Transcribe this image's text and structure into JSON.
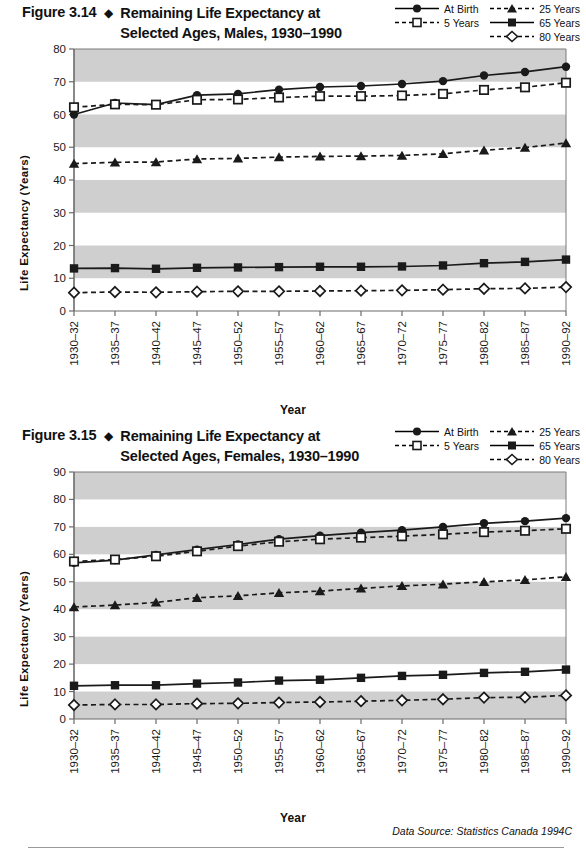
{
  "page": {
    "source_note": "Data Source: Statistics Canada 1994C"
  },
  "figures": [
    {
      "number": "Figure 3.14",
      "separator": "◆",
      "title_line1": "Remaining Life Expectancy at",
      "title_line2": "Selected Ages, Males, 1930–1990",
      "xlabel": "Year",
      "ylabel": "Life Expectancy (Years)",
      "legend": [
        {
          "label": "At Birth",
          "marker": "circle-filled",
          "dash": "solid"
        },
        {
          "label": "25 Years",
          "marker": "triangle-filled",
          "dash": "dashed"
        },
        {
          "label": "5 Years",
          "marker": "square-open",
          "dash": "dashed"
        },
        {
          "label": "65 Years",
          "marker": "square-filled",
          "dash": "solid"
        },
        {
          "label": "80 Years",
          "marker": "diamond-open",
          "dash": "dashed"
        }
      ]
    },
    {
      "number": "Figure 3.15",
      "separator": "◆",
      "title_line1": "Remaining Life Expectancy at",
      "title_line2": "Selected Ages, Females, 1930–1990",
      "xlabel": "Year",
      "ylabel": "Life Expectancy (Years)",
      "legend": [
        {
          "label": "At Birth",
          "marker": "circle-filled",
          "dash": "solid"
        },
        {
          "label": "25 Years",
          "marker": "triangle-filled",
          "dash": "dashed"
        },
        {
          "label": "5 Years",
          "marker": "square-open",
          "dash": "dashed"
        },
        {
          "label": "65 Years",
          "marker": "square-filled",
          "dash": "solid"
        },
        {
          "label": "80 Years",
          "marker": "diamond-open",
          "dash": "dashed"
        }
      ]
    }
  ],
  "chart_data": [
    {
      "type": "line",
      "title": "Figure 3.14 ◆ Remaining Life Expectancy at Selected Ages, Males, 1930–1990",
      "xlabel": "Year",
      "ylabel": "Life Expectancy (Years)",
      "ylim": [
        0,
        80
      ],
      "yticks": [
        0,
        10,
        20,
        30,
        40,
        50,
        60,
        70,
        80
      ],
      "grid": "horizontal-bands",
      "legend_position": "top-right",
      "categories": [
        "1930–32",
        "1935–37",
        "1940–42",
        "1945–47",
        "1950–52",
        "1955–57",
        "1960–62",
        "1965–67",
        "1970–72",
        "1975–77",
        "1980–82",
        "1985–87",
        "1990–92"
      ],
      "series": [
        {
          "name": "At Birth",
          "marker": "circle-filled",
          "dash": "solid",
          "values": [
            60.0,
            63.5,
            63.0,
            65.9,
            66.3,
            67.6,
            68.4,
            68.7,
            69.3,
            70.2,
            71.9,
            73.0,
            74.6
          ]
        },
        {
          "name": "5 Years",
          "marker": "square-open",
          "dash": "dashed",
          "values": [
            62.2,
            63.1,
            63.0,
            64.5,
            64.6,
            65.2,
            65.6,
            65.6,
            65.8,
            66.3,
            67.5,
            68.3,
            69.7
          ]
        },
        {
          "name": "25 Years",
          "marker": "triangle-filled",
          "dash": "dashed",
          "values": [
            45.0,
            45.4,
            45.5,
            46.4,
            46.6,
            47.0,
            47.2,
            47.3,
            47.5,
            48.0,
            49.1,
            49.9,
            51.3
          ]
        },
        {
          "name": "65 Years",
          "marker": "square-filled",
          "dash": "solid",
          "values": [
            13.0,
            13.1,
            12.9,
            13.2,
            13.3,
            13.4,
            13.5,
            13.5,
            13.6,
            13.9,
            14.6,
            15.0,
            15.7
          ]
        },
        {
          "name": "80 Years",
          "marker": "diamond-open",
          "dash": "dashed",
          "values": [
            5.6,
            5.8,
            5.7,
            5.9,
            6.0,
            6.0,
            6.1,
            6.2,
            6.3,
            6.5,
            6.8,
            6.9,
            7.3
          ]
        }
      ]
    },
    {
      "type": "line",
      "title": "Figure 3.15 ◆ Remaining Life Expectancy at Selected Ages, Females, 1930–1990",
      "xlabel": "Year",
      "ylabel": "Life Expectancy (Years)",
      "ylim": [
        0,
        90
      ],
      "yticks": [
        0,
        10,
        20,
        30,
        40,
        50,
        60,
        70,
        80,
        90
      ],
      "grid": "horizontal-bands",
      "legend_position": "top-right",
      "categories": [
        "1930–32",
        "1935–37",
        "1940–42",
        "1945–47",
        "1950–52",
        "1955–57",
        "1960–62",
        "1965–67",
        "1970–72",
        "1975–77",
        "1980–82",
        "1985–87",
        "1990–92"
      ],
      "series": [
        {
          "name": "At Birth",
          "marker": "circle-filled",
          "dash": "solid",
          "values": [
            56.9,
            57.9,
            59.8,
            61.7,
            63.6,
            65.5,
            66.8,
            67.9,
            68.8,
            70.0,
            71.3,
            72.1,
            73.2
          ]
        },
        {
          "name": "5 Years",
          "marker": "square-open",
          "dash": "dashed",
          "values": [
            57.4,
            58.1,
            59.3,
            61.1,
            63.0,
            64.6,
            65.5,
            66.1,
            66.6,
            67.3,
            68.1,
            68.6,
            69.3
          ]
        },
        {
          "name": "25 Years",
          "marker": "triangle-filled",
          "dash": "dashed",
          "values": [
            40.8,
            41.5,
            42.5,
            44.2,
            44.9,
            46.0,
            46.6,
            47.6,
            48.5,
            49.1,
            50.0,
            50.7,
            51.8
          ]
        },
        {
          "name": "65 Years",
          "marker": "square-filled",
          "dash": "solid",
          "values": [
            12.1,
            12.3,
            12.3,
            12.9,
            13.3,
            14.0,
            14.3,
            15.0,
            15.7,
            16.1,
            16.8,
            17.2,
            18.0
          ]
        },
        {
          "name": "80 Years",
          "marker": "diamond-open",
          "dash": "dashed",
          "values": [
            5.1,
            5.3,
            5.3,
            5.6,
            5.7,
            6.0,
            6.2,
            6.5,
            6.8,
            7.2,
            7.8,
            7.9,
            8.6
          ]
        }
      ]
    }
  ]
}
